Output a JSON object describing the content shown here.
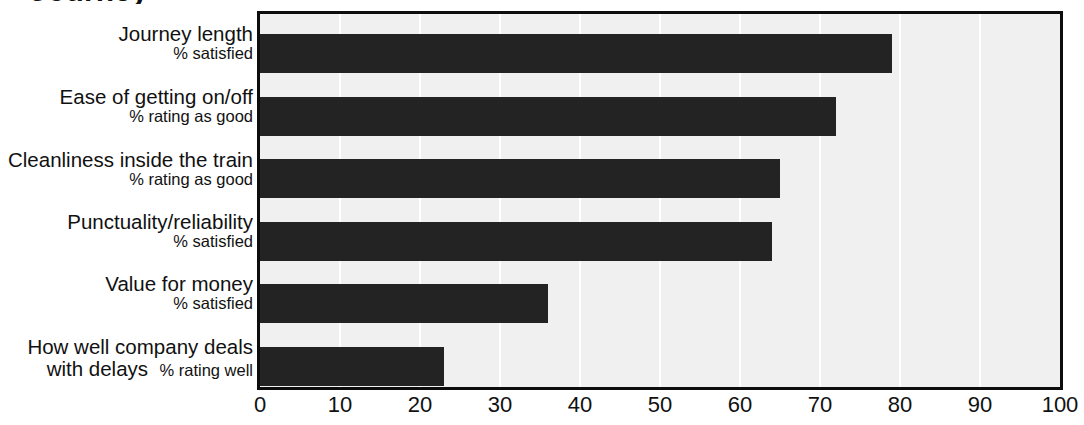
{
  "chart_data": {
    "type": "bar",
    "orientation": "horizontal",
    "title": "Journey",
    "xlabel": "",
    "ylabel": "",
    "xlim": [
      0,
      100
    ],
    "xticks": [
      "0",
      "10",
      "20",
      "30",
      "40",
      "50",
      "60",
      "70",
      "80",
      "90",
      "100"
    ],
    "grid": "vertical gridlines at every x tick",
    "legend": "none",
    "bar_color": "#232323",
    "plot_background": "#f0f0f0",
    "categories": [
      "Journey length",
      "Ease of getting on/off",
      "Cleanliness inside the train",
      "Punctuality/reliability",
      "Value for money",
      "How well company deals with delays"
    ],
    "category_sublabels": [
      "% satisfied",
      "% rating as good",
      "% rating as good",
      "% satisfied",
      "% satisfied",
      "% rating well"
    ],
    "values": [
      79,
      72,
      65,
      64,
      36,
      23
    ],
    "items": [
      {
        "line1": "Journey length",
        "line2": "",
        "sub": "% satisfied",
        "inline": false,
        "value": 79
      },
      {
        "line1": "Ease of getting on/off",
        "line2": "",
        "sub": "% rating as good",
        "inline": false,
        "value": 72
      },
      {
        "line1": "Cleanliness inside the train",
        "line2": "",
        "sub": "% rating as good",
        "inline": false,
        "value": 65
      },
      {
        "line1": "Punctuality/reliability",
        "line2": "",
        "sub": "% satisfied",
        "inline": false,
        "value": 64
      },
      {
        "line1": "Value for money",
        "line2": "",
        "sub": "% satisfied",
        "inline": false,
        "value": 36
      },
      {
        "line1": "How well company deals",
        "line2": "with delays",
        "sub": "% rating well",
        "inline": true,
        "value": 23
      }
    ]
  }
}
